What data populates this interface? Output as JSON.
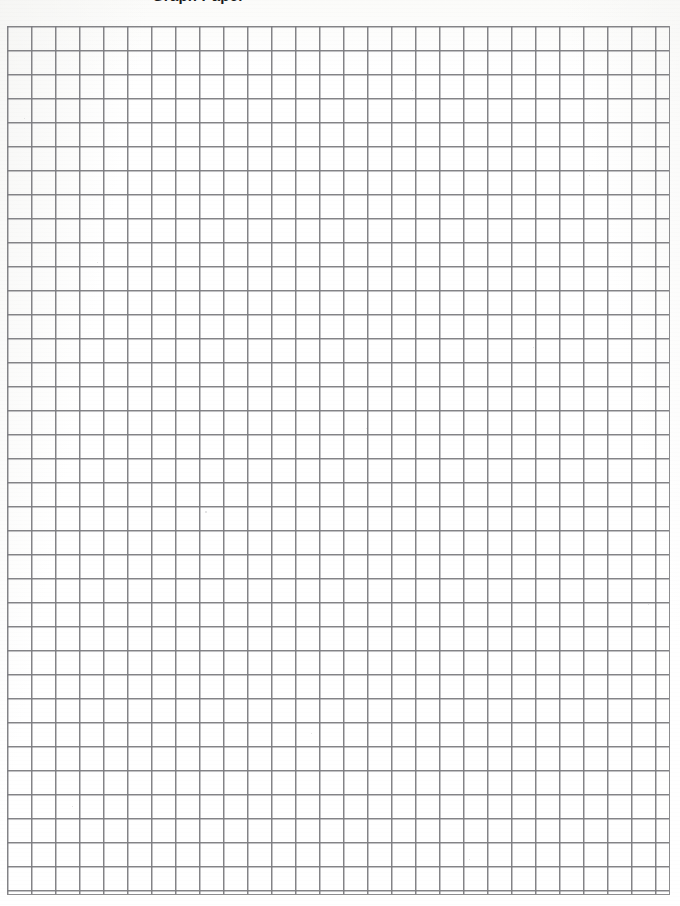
{
  "document": {
    "kind": "scanned-graph-paper",
    "page_width": 680,
    "page_height": 906,
    "paper_color": "#fdfdfd",
    "background_color": "#ffffff"
  },
  "heading": {
    "clipped_text": "Graph Paper",
    "note": "heading is cropped off at the top edge of the scan; only the lower sliver of the glyphs is visible"
  },
  "grid": {
    "line_color": "#8c8c8e",
    "line_width_px": 1,
    "cell_width_px": 24,
    "cell_height_px": 24,
    "columns": 27,
    "rows": 36,
    "origin_x_px": 7,
    "origin_y_px": 26,
    "width_px": 663,
    "height_px": 869
  },
  "speckles": [
    {
      "x": 24,
      "y": 118,
      "size": 1
    },
    {
      "x": 97,
      "y": 262,
      "size": 1
    },
    {
      "x": 412,
      "y": 90,
      "size": 1
    },
    {
      "x": 533,
      "y": 347,
      "size": 1
    },
    {
      "x": 205,
      "y": 511,
      "size": 2
    },
    {
      "x": 648,
      "y": 604,
      "size": 1
    },
    {
      "x": 311,
      "y": 733,
      "size": 1
    },
    {
      "x": 72,
      "y": 806,
      "size": 1
    },
    {
      "x": 469,
      "y": 859,
      "size": 1
    },
    {
      "x": 589,
      "y": 175,
      "size": 1
    },
    {
      "x": 152,
      "y": 655,
      "size": 1
    },
    {
      "x": 366,
      "y": 428,
      "size": 1
    }
  ]
}
